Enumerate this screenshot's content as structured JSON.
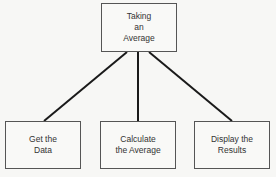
{
  "diagram": {
    "root": {
      "label": "Taking\nan\nAverage"
    },
    "children": [
      {
        "label": "Get the\nData"
      },
      {
        "label": "Calculate\nthe Average"
      },
      {
        "label": "Display the\nResults"
      }
    ],
    "line_color": "#1a1a1a"
  }
}
